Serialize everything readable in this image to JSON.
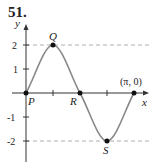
{
  "problem_number": "51.",
  "axes": {
    "x_label": "x",
    "y_label": "y"
  },
  "y_ticks": [
    "2",
    "1",
    "-1",
    "-2"
  ],
  "points": {
    "P": "P",
    "Q": "Q",
    "R": "R",
    "S": "S",
    "end": "(π, 0)"
  },
  "curve": {
    "function": "y = 2 sin(2x)",
    "amplitude": 2,
    "period": "π",
    "color": "#888888"
  },
  "dashed_lines_y": [
    2,
    -2
  ]
}
